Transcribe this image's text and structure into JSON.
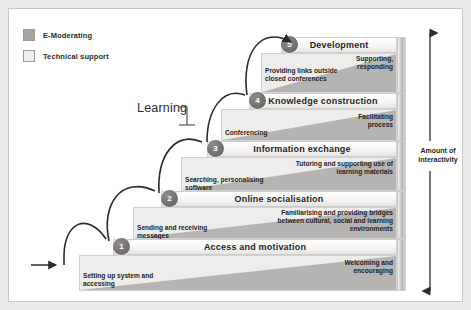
{
  "legend": {
    "items": [
      {
        "label": "E-Moderating",
        "color": "#a6a4a2",
        "icon": "square-swatch-icon"
      },
      {
        "label": "Technical support",
        "color": "#eeeceb",
        "icon": "square-swatch-icon"
      }
    ]
  },
  "annotations": {
    "learning": "Learning",
    "interactivity": "Amount of interactivity"
  },
  "steps": [
    {
      "number": "1",
      "title": "Access and motivation",
      "technical_support": "Setting up system and accessing",
      "e_moderating": "Welcoming and encouraging"
    },
    {
      "number": "2",
      "title": "Online socialisation",
      "technical_support": "Sending and receiving messages",
      "e_moderating": "Familiarising and providing bridges between cultural, social and learning environments"
    },
    {
      "number": "3",
      "title": "Information exchange",
      "technical_support": "Searching, personalising software",
      "e_moderating": "Tutoring and supporting use of learning materials"
    },
    {
      "number": "4",
      "title": "Knowledge construction",
      "technical_support": "Conferencing",
      "e_moderating": "Facilitating process"
    },
    {
      "number": "5",
      "title": "Development",
      "technical_support": "Providing links outside closed conferences",
      "e_moderating": "Supporting, responding"
    }
  ]
}
